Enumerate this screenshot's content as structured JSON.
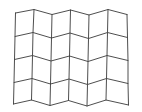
{
  "figure": {
    "background_color": "#ffffff",
    "line_color": "#3a3a3a",
    "line_width": 0.9,
    "canvas": {
      "width": 142,
      "height": 112
    }
  },
  "chart_data": {
    "type": "mesh",
    "title": "",
    "xlabel": "",
    "ylabel": "",
    "grid": true,
    "legend": "none",
    "cols": 6,
    "rows": 4,
    "xlim": [
      0,
      142
    ],
    "ylim": [
      0,
      112
    ],
    "nodes": [
      [
        [
          15.5,
          13.0
        ],
        [
          34.0,
          9.5
        ],
        [
          52.0,
          14.5
        ],
        [
          70.5,
          10.0
        ],
        [
          89.0,
          15.0
        ],
        [
          108.0,
          9.5
        ],
        [
          127.0,
          14.5
        ]
      ],
      [
        [
          15.0,
          36.5
        ],
        [
          33.0,
          32.5
        ],
        [
          51.5,
          38.0
        ],
        [
          70.0,
          33.0
        ],
        [
          88.5,
          38.5
        ],
        [
          107.5,
          32.5
        ],
        [
          127.5,
          37.5
        ]
      ],
      [
        [
          14.5,
          59.5
        ],
        [
          32.5,
          55.5
        ],
        [
          51.0,
          61.0
        ],
        [
          69.5,
          56.0
        ],
        [
          88.0,
          61.5
        ],
        [
          107.0,
          55.5
        ],
        [
          128.0,
          60.5
        ]
      ],
      [
        [
          14.0,
          82.5
        ],
        [
          32.0,
          78.5
        ],
        [
          50.5,
          84.0
        ],
        [
          69.0,
          79.0
        ],
        [
          87.5,
          84.5
        ],
        [
          106.5,
          78.5
        ],
        [
          128.0,
          83.5
        ]
      ],
      [
        [
          13.5,
          104.0
        ],
        [
          31.5,
          100.0
        ],
        [
          50.0,
          105.5
        ],
        [
          68.5,
          100.5
        ],
        [
          87.0,
          106.0
        ],
        [
          106.0,
          100.0
        ],
        [
          128.5,
          105.0
        ]
      ]
    ]
  }
}
